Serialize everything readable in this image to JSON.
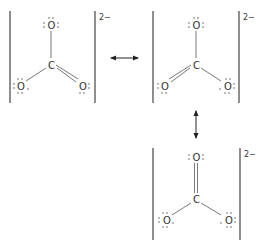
{
  "diagram": {
    "structures": [
      {
        "id": "structure-1",
        "charge": "2−",
        "atoms": {
          "top": "O",
          "center": "C",
          "left": "O",
          "right": "O"
        },
        "double_bond": "right"
      },
      {
        "id": "structure-2",
        "charge": "2−",
        "atoms": {
          "top": "O",
          "center": "C",
          "left": "O",
          "right": "O"
        },
        "double_bond": "left"
      },
      {
        "id": "structure-3",
        "charge": "2−",
        "atoms": {
          "top": "O",
          "center": "C",
          "left": "O",
          "right": "O"
        },
        "double_bond": "top"
      }
    ],
    "arrows": [
      {
        "name": "resonance-arrow-horizontal",
        "from": "structure-1",
        "to": "structure-2",
        "icon": "double-headed-arrow"
      },
      {
        "name": "resonance-arrow-vertical",
        "from": "structure-2",
        "to": "structure-3",
        "icon": "double-headed-arrow"
      }
    ]
  }
}
